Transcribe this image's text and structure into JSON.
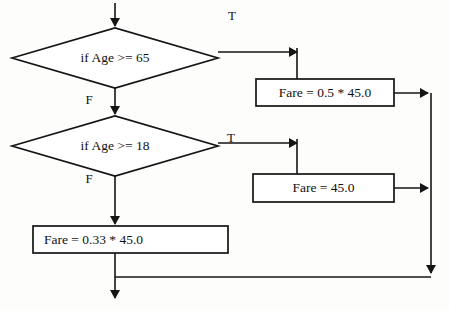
{
  "diagram": {
    "type": "flowchart",
    "canvas": {
      "width": 449,
      "height": 311
    },
    "colors": {
      "stroke": "#151515",
      "fill": "#ffffff",
      "background": "#fdfdfc",
      "text": "#111111"
    },
    "nodes": [
      {
        "id": "decision_age_65",
        "kind": "decision",
        "label": "if  Age >= 65",
        "cx": 115,
        "cy": 58,
        "halfWidth": 103,
        "halfHeight": 30
      },
      {
        "id": "decision_age_18",
        "kind": "decision",
        "label": "if  Age >= 18",
        "cx": 115,
        "cy": 146,
        "halfWidth": 103,
        "halfHeight": 30
      },
      {
        "id": "process_fare_half",
        "kind": "process",
        "label": "Fare = 0.5 * 45.0",
        "x": 256,
        "y": 79,
        "width": 138,
        "height": 27,
        "align": "center"
      },
      {
        "id": "process_fare_full",
        "kind": "process",
        "label": "Fare = 45.0",
        "x": 253,
        "y": 174,
        "width": 141,
        "height": 28,
        "align": "center"
      },
      {
        "id": "process_fare_child",
        "kind": "process",
        "label": "Fare = 0.33 * 45.0",
        "x": 33,
        "y": 226,
        "width": 195,
        "height": 27,
        "align": "left"
      }
    ],
    "edge_labels": [
      {
        "id": "label_true_65",
        "text": "T",
        "x": 232,
        "y": 17
      },
      {
        "id": "label_false_65",
        "text": "F",
        "x": 89,
        "y": 101
      },
      {
        "id": "label_true_18",
        "text": "T",
        "x": 231,
        "y": 139
      },
      {
        "id": "label_false_18",
        "text": "F",
        "x": 89,
        "y": 180
      }
    ],
    "edges": [
      {
        "id": "edge_entry",
        "from": "start",
        "to": "decision_age_65",
        "path": "M115,3 L115,26"
      },
      {
        "id": "edge_true_65",
        "from": "decision_age_65",
        "to": "process_fare_half",
        "path": "M218,52 L297,52 M297,48 L297,79"
      },
      {
        "id": "edge_false_65",
        "from": "decision_age_65",
        "to": "decision_age_18",
        "path": "M115,88 L115,114"
      },
      {
        "id": "edge_true_18",
        "from": "decision_age_18",
        "to": "process_fare_full",
        "path": "M218,143 L297,143 M297,139 L297,174"
      },
      {
        "id": "edge_false_18",
        "from": "decision_age_18",
        "to": "process_fare_child",
        "path": "M115,176 L115,224"
      },
      {
        "id": "edge_half_to_trunk",
        "from": "process_fare_half",
        "to": "merge_trunk",
        "path": "M394,93 L428,93"
      },
      {
        "id": "edge_full_to_trunk",
        "from": "process_fare_full",
        "to": "merge_trunk",
        "path": "M394,188 L428,188"
      },
      {
        "id": "edge_trunk_down",
        "from": "merge_trunk",
        "to": "merge_bottom",
        "path": "M431,93 L431,273"
      },
      {
        "id": "edge_bottom_join",
        "from": "merge_bottom",
        "to": "exit_line",
        "path": "M431,277 L115,277"
      },
      {
        "id": "edge_child_down",
        "from": "process_fare_child",
        "to": "exit",
        "path": "M115,253 L115,298"
      }
    ],
    "arrowheads": [
      {
        "id": "arrow_entry",
        "x": 115,
        "y": 27,
        "dir": "down"
      },
      {
        "id": "arrow_true_65",
        "x": 298,
        "y": 52,
        "dir": "right"
      },
      {
        "id": "arrow_false_65",
        "x": 115,
        "y": 115,
        "dir": "down"
      },
      {
        "id": "arrow_true_18",
        "x": 298,
        "y": 143,
        "dir": "right"
      },
      {
        "id": "arrow_false_18",
        "x": 115,
        "y": 225,
        "dir": "down"
      },
      {
        "id": "arrow_half_trunk",
        "x": 429,
        "y": 93,
        "dir": "right"
      },
      {
        "id": "arrow_full_trunk",
        "x": 429,
        "y": 188,
        "dir": "right"
      },
      {
        "id": "arrow_trunk_bottom",
        "x": 431,
        "y": 274,
        "dir": "down"
      },
      {
        "id": "arrow_exit",
        "x": 115,
        "y": 299,
        "dir": "down"
      }
    ]
  }
}
